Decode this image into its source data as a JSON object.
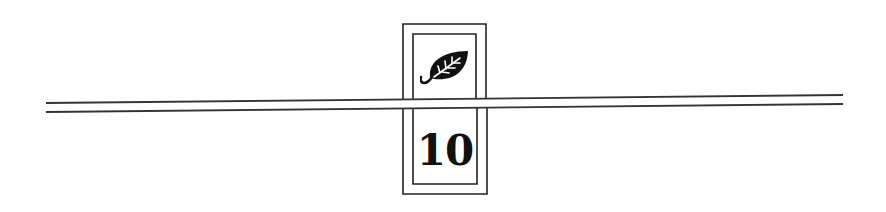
{
  "marker": {
    "icon": "leaf-icon",
    "number": "10"
  },
  "colors": {
    "ink": "#1a1a1a",
    "background": "#ffffff"
  }
}
